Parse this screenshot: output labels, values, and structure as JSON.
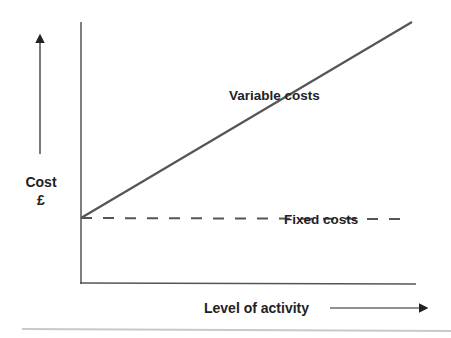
{
  "chart_data": {
    "type": "line",
    "title": "",
    "xlabel": "Level of activity",
    "ylabel": "Cost",
    "ylabel_unit": "£",
    "xlim": [
      0,
      1
    ],
    "ylim": [
      0,
      1
    ],
    "grid": false,
    "series": [
      {
        "name": "Variable costs",
        "style": "solid",
        "x": [
          0,
          1
        ],
        "y": [
          0.25,
          1.0
        ],
        "color": "#555555"
      },
      {
        "name": "Fixed costs",
        "style": "dashed",
        "x": [
          0,
          1
        ],
        "y": [
          0.25,
          0.25
        ],
        "color": "#555555"
      }
    ],
    "annotations": [
      {
        "text": "Variable costs",
        "series": "Variable costs"
      },
      {
        "text": "Fixed costs",
        "series": "Fixed costs"
      }
    ]
  }
}
